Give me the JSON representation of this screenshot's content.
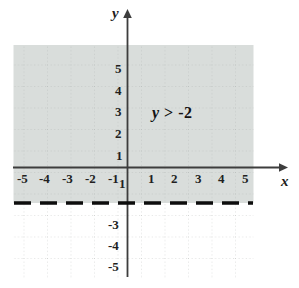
{
  "figure": {
    "kind": "cartesian-coordinate-plane"
  },
  "axes": {
    "x_axis_name": "x",
    "y_axis_name": "y",
    "x_ticks": [
      "-5",
      "-4",
      "-3",
      "-2",
      "-1",
      "1",
      "2",
      "3",
      "4",
      "5"
    ],
    "y_ticks_positive": [
      "5",
      "4",
      "3",
      "2",
      "1"
    ],
    "y_ticks_negative": [
      "1",
      "-3",
      "-4",
      "-5"
    ],
    "y_tick_minus_one": "1",
    "y_tick_minus_three": "-3",
    "y_tick_minus_four": "-4",
    "y_tick_minus_five": "-5",
    "xlim": [
      -5.9,
      6.6
    ],
    "ylim": [
      -5.6,
      5.9
    ],
    "grid": "dotted"
  },
  "annotation": {
    "variable": "y",
    "operator": ">",
    "value": "-2",
    "full_text": "y > -2"
  },
  "boundary_line": {
    "equation": "y = -2",
    "style": "dashed",
    "inclusive": false
  },
  "shaded_region": {
    "condition": "y > -2",
    "position": "above the dashed line"
  },
  "colors": {
    "shading": "#d8dcda",
    "axis": "#3d3d3d",
    "grid_dot": "#b9bcbb",
    "boundary": "#0d0d0d",
    "text": "#1d1b1b",
    "background": "#ffffff"
  }
}
